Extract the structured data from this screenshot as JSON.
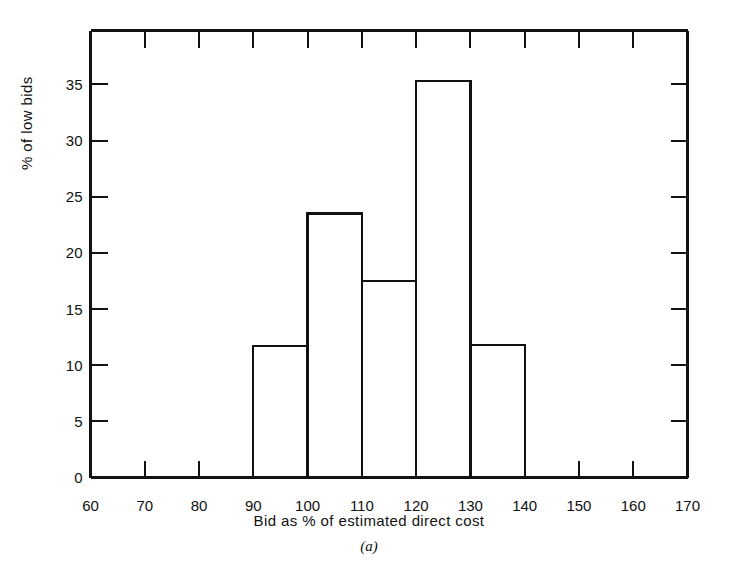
{
  "figure": {
    "caption": "(a)",
    "xlabel": "Bid as % of estimated direct cost",
    "ylabel": "% of low bids",
    "line_color": "#111111",
    "background": "#ffffff"
  },
  "chart_data": {
    "type": "bar",
    "title": "",
    "xlabel": "Bid as % of estimated direct cost",
    "ylabel": "% of low bids",
    "xlim": [
      60,
      170
    ],
    "ylim": [
      0,
      39.8
    ],
    "xticks": [
      60,
      70,
      80,
      90,
      100,
      110,
      120,
      130,
      140,
      150,
      160,
      170
    ],
    "xtick_labels": [
      "60",
      "70",
      "80",
      "90",
      "100",
      "110",
      "120",
      "130",
      "140",
      "150",
      "160",
      "170"
    ],
    "yticks": [
      0,
      5,
      10,
      15,
      20,
      25,
      30,
      35
    ],
    "ytick_labels": [
      "0",
      "5",
      "10",
      "15",
      "20",
      "25",
      "30",
      "35"
    ],
    "grid": false,
    "legend": false,
    "bin_width": 10,
    "bin_edges": [
      90,
      100,
      110,
      120,
      130,
      140
    ],
    "categories": [
      "90-100",
      "100-110",
      "110-120",
      "120-130",
      "130-140"
    ],
    "values": [
      11.7,
      23.5,
      17.5,
      35.3,
      11.8
    ],
    "bars": [
      {
        "x0": 90,
        "x1": 100,
        "height": 11.7
      },
      {
        "x0": 100,
        "x1": 110,
        "height": 23.5
      },
      {
        "x0": 110,
        "x1": 120,
        "height": 17.5
      },
      {
        "x0": 120,
        "x1": 130,
        "height": 35.3
      },
      {
        "x0": 130,
        "x1": 140,
        "height": 11.8
      }
    ]
  }
}
